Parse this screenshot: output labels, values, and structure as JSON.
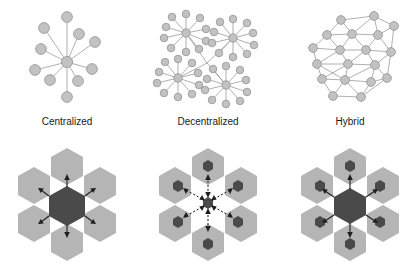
{
  "figure": {
    "title_visible": false,
    "background_color": "#ffffff",
    "columns": [
      {
        "key": "centralized",
        "label": "Centralized",
        "graph": {
          "type": "hub-and-spoke",
          "hub_count": 1,
          "leaf_count": 10,
          "description": "Single central hub node connected to ten peripheral nodes"
        },
        "hex_diagram": {
          "outer_hexagons": 6,
          "center_hexagon": "large-dark",
          "center_hexagon_color": "#4a4a4a",
          "outer_hexagon_color": "#b5b5b5",
          "small_dark_nodes": 0,
          "arrow_count": 6,
          "arrow_style": "solid",
          "arrow_direction": "outward"
        }
      },
      {
        "key": "decentralized",
        "label": "Decentralized",
        "graph": {
          "type": "multi-hub",
          "hub_count": 4,
          "leaves_per_hub": 11,
          "description": "Four hub-and-spoke clusters linked through a central junction"
        },
        "hex_diagram": {
          "outer_hexagons": 6,
          "center_hexagon": "none",
          "center_node": "small-dark",
          "outer_hexagon_color": "#b5b5b5",
          "small_dark_nodes": 7,
          "small_dark_node_color": "#4a4a4a",
          "arrow_count": 6,
          "arrow_style": "dashed",
          "arrow_direction": "bidirectional"
        }
      },
      {
        "key": "hybrid",
        "label": "Hybrid",
        "graph": {
          "type": "mesh",
          "node_count": 20,
          "description": "Dense triangulated mesh lattice with many interconnections"
        },
        "hex_diagram": {
          "outer_hexagons": 6,
          "center_hexagon": "large-dark",
          "center_hexagon_color": "#4a4a4a",
          "outer_hexagon_color": "#b5b5b5",
          "small_dark_nodes": 6,
          "small_dark_node_color": "#4a4a4a",
          "arrow_count": 6,
          "arrow_style": "solid",
          "arrow_direction": "outward"
        }
      }
    ],
    "colors": {
      "node_fill": "#c2c2c2",
      "node_stroke": "#8a8a8a",
      "edge": "#8e8e8e",
      "hex_light": "#b5b5b5",
      "hex_dark": "#4a4a4a",
      "label_text": "#1a1a1a",
      "arrow": "#1f1f1f"
    }
  }
}
